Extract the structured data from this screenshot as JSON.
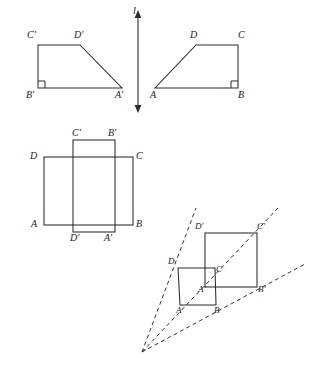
{
  "figure": {
    "stroke_color": "#2b2b2b",
    "dash_color": "#333333",
    "background": "#ffffff",
    "panels": [
      {
        "name": "reflection-panel",
        "description": "Two congruent trapezoids reflected across vertical line l",
        "line_label": "l",
        "shape_left": {
          "name": "trapezoid-image",
          "vertices": [
            {
              "label": "C'",
              "x": 38,
              "y": 45
            },
            {
              "label": "D'",
              "x": 80,
              "y": 45
            },
            {
              "label": "A'",
              "x": 122,
              "y": 88
            },
            {
              "label": "B'",
              "x": 38,
              "y": 88
            }
          ],
          "right_angle_at": "B'"
        },
        "shape_right": {
          "name": "trapezoid-preimage",
          "vertices": [
            {
              "label": "D",
              "x": 196,
              "y": 45
            },
            {
              "label": "C",
              "x": 238,
              "y": 45
            },
            {
              "label": "B",
              "x": 238,
              "y": 88
            },
            {
              "label": "A",
              "x": 155,
              "y": 88
            }
          ],
          "right_angle_at": "B"
        }
      },
      {
        "name": "rotation-panel",
        "description": "Two overlapping congruent squares showing a rotation",
        "shape_preimage": {
          "name": "square-abcd",
          "vertices": [
            {
              "label": "D",
              "x": 44,
              "y": 157
            },
            {
              "label": "C",
              "x": 133,
              "y": 157
            },
            {
              "label": "B",
              "x": 133,
              "y": 225
            },
            {
              "label": "A",
              "x": 44,
              "y": 225
            }
          ]
        },
        "shape_image": {
          "name": "square-a-b-c-d-prime",
          "vertices": [
            {
              "label": "C'",
              "x": 73,
              "y": 140
            },
            {
              "label": "B'",
              "x": 115,
              "y": 140
            },
            {
              "label": "A'",
              "x": 115,
              "y": 232
            },
            {
              "label": "D'",
              "x": 73,
              "y": 232
            }
          ]
        }
      },
      {
        "name": "dilation-panel",
        "description": "Dilation of square ABCD from a center of projection with dashed rays",
        "center_of_projection": {
          "x": 142,
          "y": 352
        },
        "shape_preimage": {
          "name": "small-square-abcd",
          "vertices": [
            {
              "label": "D",
              "x": 178,
              "y": 268
            },
            {
              "label": "C",
              "x": 215,
              "y": 268
            },
            {
              "label": "B",
              "x": 216,
              "y": 305
            },
            {
              "label": "A",
              "x": 180,
              "y": 305
            }
          ]
        },
        "shape_image": {
          "name": "large-square-a-b-c-d-prime",
          "vertices": [
            {
              "label": "D'",
              "x": 205,
              "y": 233
            },
            {
              "label": "C'",
              "x": 257,
              "y": 233
            },
            {
              "label": "B'",
              "x": 257,
              "y": 287
            },
            {
              "label": "A'",
              "x": 205,
              "y": 287
            }
          ]
        },
        "rays": [
          {
            "name": "ray-through-d",
            "to_x": 196,
            "to_y": 208
          },
          {
            "name": "ray-through-c",
            "to_x": 278,
            "to_y": 208
          },
          {
            "name": "ray-through-b",
            "to_x": 305,
            "to_y": 264
          }
        ]
      }
    ],
    "labels": {
      "line_l": "l",
      "t1_c_prime": "C'",
      "t1_d_prime": "D'",
      "t1_b_prime": "B'",
      "t1_a_prime": "A'",
      "t2_d": "D",
      "t2_c": "C",
      "t2_a": "A",
      "t2_b": "B",
      "sq_c_prime": "C'",
      "sq_b_prime": "B'",
      "sq_d": "D",
      "sq_c": "C",
      "sq_a": "A",
      "sq_b": "B",
      "sq_d_prime": "D'",
      "sq_a_prime": "A'",
      "dl_d_prime": "D'",
      "dl_c_prime": "C'",
      "dl_d": "D",
      "dl_c": "C",
      "dl_a_prime": "A'",
      "dl_b_prime": "B'",
      "dl_a": "A",
      "dl_b": "B"
    }
  }
}
